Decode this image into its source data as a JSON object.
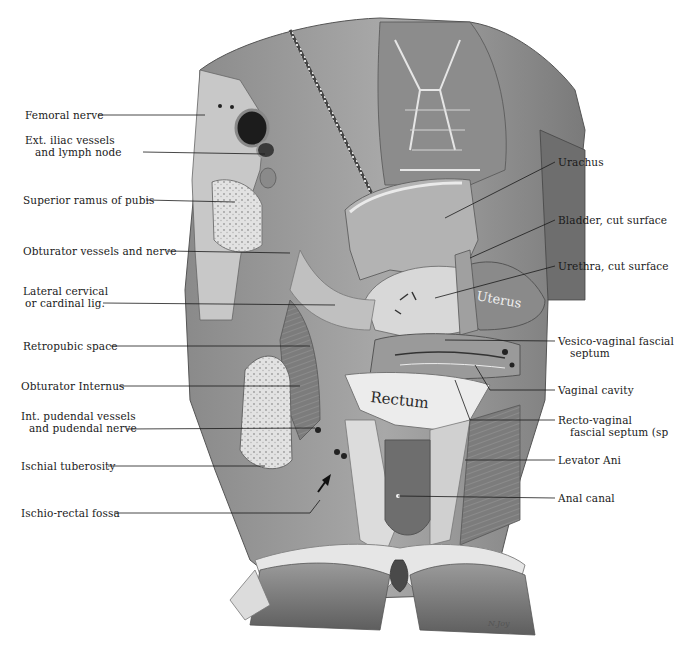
{
  "figure": {
    "type": "anatomical illustration",
    "signature": "N. Joy",
    "organ_annotations": [
      {
        "id": "rectum",
        "text": "Rectum"
      },
      {
        "id": "uterus",
        "text": "Uterus"
      }
    ]
  },
  "labels_left": [
    {
      "id": "femoral-nerve",
      "lines": [
        "Femoral nerve"
      ]
    },
    {
      "id": "ext-iliac",
      "lines": [
        "Ext. iliac vessels",
        "and lymph node"
      ]
    },
    {
      "id": "superior-ramus",
      "lines": [
        "Superior ramus of pubis"
      ]
    },
    {
      "id": "obturator-vessels",
      "lines": [
        "Obturator vessels and nerve"
      ]
    },
    {
      "id": "lateral-cervical",
      "lines": [
        "Lateral cervical",
        "or cardinal lig."
      ]
    },
    {
      "id": "retropubic",
      "lines": [
        "Retropubic space"
      ]
    },
    {
      "id": "obturator-internus",
      "lines": [
        "Obturator Internus"
      ]
    },
    {
      "id": "int-pudendal",
      "lines": [
        "Int. pudendal vessels",
        "and pudendal nerve"
      ]
    },
    {
      "id": "ischial-tuberosity",
      "lines": [
        "Ischial tuberosity"
      ]
    },
    {
      "id": "ischio-rectal",
      "lines": [
        "Ischio-rectal fossa"
      ]
    }
  ],
  "labels_right": [
    {
      "id": "urachus",
      "lines": [
        "Urachus"
      ]
    },
    {
      "id": "bladder",
      "lines": [
        "Bladder, cut surface"
      ]
    },
    {
      "id": "urethra",
      "lines": [
        "Urethra, cut surface"
      ]
    },
    {
      "id": "vesico-vaginal",
      "lines": [
        "Vesico-vaginal fascial",
        "septum"
      ]
    },
    {
      "id": "vaginal-cavity",
      "lines": [
        "Vaginal cavity"
      ]
    },
    {
      "id": "recto-vaginal",
      "lines": [
        "Recto-vaginal",
        "fascial septum (sp"
      ]
    },
    {
      "id": "levator-ani",
      "lines": [
        "Levator Ani"
      ]
    },
    {
      "id": "anal-canal",
      "lines": [
        "Anal canal"
      ]
    }
  ],
  "colors": {
    "ink": "#1a1a1a",
    "tissue_dark": "#6e6e6e",
    "tissue_mid": "#9a9a9a",
    "tissue_light": "#cfcfcf",
    "bone": "#e4e4e4",
    "background": "#ffffff"
  }
}
